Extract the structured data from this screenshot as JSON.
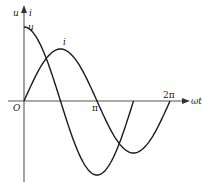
{
  "figure": {
    "type": "waveform-diagram",
    "axes": {
      "y_label_u": "u",
      "y_label_sep": "",
      "y_label_i": "i",
      "x_label": "ωt",
      "origin_label": "O",
      "tick_pi": "π",
      "tick_2pi": "2π"
    },
    "curves": [
      {
        "name": "u",
        "label": "u",
        "function": "U·cos(ωt)",
        "relative_amplitude": 1.0,
        "range": "0 to 3π/2"
      },
      {
        "name": "i",
        "label": "i",
        "function": "I·sin(ωt)",
        "relative_amplitude": 0.7,
        "range": "0 to 2π"
      }
    ],
    "colors": {
      "line": "#1a1a1a",
      "axis": "#444444",
      "background": "#ffffff"
    }
  }
}
